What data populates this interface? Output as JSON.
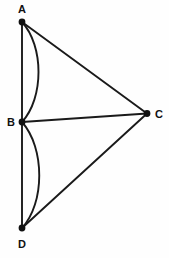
{
  "figure": {
    "type": "geometry-diagram",
    "background_color": "#fefefe",
    "stroke_color": "#1a1a1a",
    "label_color": "#111111",
    "width": 169,
    "height": 258,
    "points": [
      {
        "id": "A",
        "label": "A",
        "x": 22,
        "y": 22,
        "label_x": 22,
        "label_y": 11,
        "label_anchor": "middle"
      },
      {
        "id": "B",
        "label": "B",
        "x": 22,
        "y": 122,
        "label_x": 11,
        "label_y": 126,
        "label_anchor": "middle"
      },
      {
        "id": "C",
        "label": "C",
        "x": 147,
        "y": 113.5,
        "label_x": 158,
        "label_y": 118,
        "label_anchor": "middle"
      },
      {
        "id": "D",
        "label": "D",
        "x": 22,
        "y": 228,
        "label_x": 22,
        "label_y": 247,
        "label_anchor": "middle"
      }
    ],
    "segments": [
      {
        "id": "AB",
        "from": "A",
        "to": "B",
        "x1": 22,
        "y1": 22,
        "x2": 22,
        "y2": 122
      },
      {
        "id": "BD",
        "from": "B",
        "to": "D",
        "x1": 22,
        "y1": 122,
        "x2": 22,
        "y2": 228
      },
      {
        "id": "AC",
        "from": "A",
        "to": "C",
        "x1": 22,
        "y1": 22,
        "x2": 147,
        "y2": 113.5
      },
      {
        "id": "BC",
        "from": "B",
        "to": "C",
        "x1": 22,
        "y1": 122,
        "x2": 147,
        "y2": 113.5
      },
      {
        "id": "DC",
        "from": "D",
        "to": "C",
        "x1": 22,
        "y1": 228,
        "x2": 147,
        "y2": 113.5
      }
    ],
    "arcs": [
      {
        "id": "arc-AB",
        "from": "A",
        "to": "B",
        "bulge_direction": "right",
        "path": "M 22 22 C 44 46, 44 98, 22 122"
      },
      {
        "id": "arc-BD",
        "from": "B",
        "to": "D",
        "bulge_direction": "right",
        "path": "M 22 122 C 45 148, 45 203, 22 228"
      }
    ],
    "vertex_dot_radius": 3.2
  }
}
